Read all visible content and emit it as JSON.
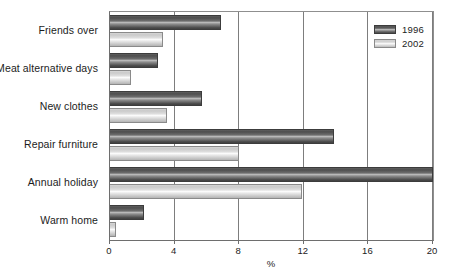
{
  "chart_data": {
    "type": "bar",
    "orientation": "horizontal",
    "title": "",
    "xlabel": "%",
    "ylabel": "",
    "xlim": [
      0,
      20
    ],
    "xticks": [
      0,
      4,
      8,
      12,
      16,
      20
    ],
    "xtick_labels": [
      "0",
      "4",
      "8",
      "12",
      "16",
      "20"
    ],
    "grid": true,
    "grid_axis": "x",
    "legend_position": "top-right",
    "categories": [
      "Friends over",
      "Meat alternative days",
      "New clothes",
      "Repair furniture",
      "Annual holiday",
      "Warm home"
    ],
    "series": [
      {
        "name": "1996",
        "color": "#4e4e4e",
        "values": [
          6.9,
          3.0,
          5.7,
          13.9,
          20.0,
          2.1
        ]
      },
      {
        "name": "2002",
        "color": "#d6d6d6",
        "values": [
          3.3,
          1.3,
          3.5,
          8.0,
          11.9,
          0.4
        ]
      }
    ]
  },
  "legend": {
    "items": [
      {
        "label": "1996"
      },
      {
        "label": "2002"
      }
    ]
  },
  "axis": {
    "x_title": "%"
  }
}
